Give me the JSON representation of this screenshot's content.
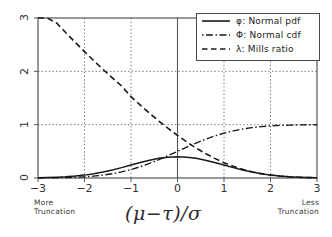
{
  "chart_data": {
    "type": "line",
    "title": "",
    "xlabel": "(μ−τ)/σ",
    "ylabel": "",
    "xlim": [
      -3,
      3
    ],
    "ylim": [
      0,
      3
    ],
    "grid": true,
    "grid_style": "dotted",
    "legend_position": "top-right",
    "xticks": [
      -3,
      -2,
      -1,
      0,
      1,
      2,
      3
    ],
    "xtick_labels": [
      "−3",
      "−2",
      "−1",
      "0",
      "1",
      "2",
      "3"
    ],
    "yticks": [
      0,
      1,
      2,
      3
    ],
    "ytick_labels": [
      "0",
      "1",
      "2",
      "3"
    ],
    "annotations": [
      {
        "text_line1": "More",
        "text_line2": "Truncation",
        "position": "below-axis-left"
      },
      {
        "text_line1": "Less",
        "text_line2": "Truncation",
        "position": "below-axis-right"
      }
    ],
    "x": [
      -3,
      -2.8,
      -2.6,
      -2.4,
      -2.2,
      -2,
      -1.8,
      -1.6,
      -1.4,
      -1.2,
      -1,
      -0.8,
      -0.6,
      -0.4,
      -0.2,
      0,
      0.2,
      0.4,
      0.6,
      0.8,
      1,
      1.2,
      1.4,
      1.6,
      1.8,
      2,
      2.2,
      2.4,
      2.6,
      2.8,
      3
    ],
    "series": [
      {
        "name": "φ: Normal pdf",
        "symbol": "φ",
        "label": "Normal pdf",
        "style": "solid",
        "color": "#1a1a1a",
        "values": [
          0.0044,
          0.0079,
          0.0136,
          0.0224,
          0.0355,
          0.054,
          0.079,
          0.1109,
          0.1497,
          0.1942,
          0.242,
          0.2897,
          0.3332,
          0.3683,
          0.391,
          0.3989,
          0.391,
          0.3683,
          0.3332,
          0.2897,
          0.242,
          0.1942,
          0.1497,
          0.1109,
          0.079,
          0.054,
          0.0355,
          0.0224,
          0.0136,
          0.0079,
          0.0044
        ]
      },
      {
        "name": "Φ: Normal cdf",
        "symbol": "Φ",
        "label": "Normal cdf",
        "style": "dashdot",
        "color": "#1a1a1a",
        "values": [
          0.0013,
          0.0026,
          0.0047,
          0.0082,
          0.0139,
          0.0228,
          0.0359,
          0.0548,
          0.0808,
          0.1151,
          0.1587,
          0.2119,
          0.2743,
          0.3446,
          0.4207,
          0.5,
          0.5793,
          0.6554,
          0.7257,
          0.7881,
          0.8413,
          0.8849,
          0.9192,
          0.9452,
          0.9641,
          0.9772,
          0.9861,
          0.9918,
          0.9953,
          0.9974,
          0.9987
        ]
      },
      {
        "name": "λ: Mills ratio",
        "symbol": "λ",
        "label": "Mills ratio",
        "style": "dashed",
        "color": "#1a1a1a",
        "values": [
          3.2831,
          3.0933,
          2.9065,
          2.7231,
          2.5437,
          2.3688,
          2.1989,
          2.0346,
          1.8763,
          1.7246,
          1.5251,
          1.3672,
          1.2147,
          1.0686,
          0.9293,
          0.7979,
          0.6749,
          0.5617,
          0.4592,
          0.3675,
          0.2876,
          0.2194,
          0.1628,
          0.1173,
          0.0819,
          0.0552,
          0.036,
          0.0226,
          0.0137,
          0.0079,
          0.0044
        ]
      }
    ]
  },
  "legend": {
    "entries": [
      {
        "sample": "solid-line-sample",
        "text": "φ: Normal pdf"
      },
      {
        "sample": "dashdot-line-sample",
        "text": "Φ: Normal cdf"
      },
      {
        "sample": "dashed-line-sample",
        "text": "λ: Mills ratio"
      }
    ]
  },
  "axis": {
    "x_title": "(μ−τ)/σ",
    "xticks": [
      "−3",
      "−2",
      "−1",
      "0",
      "1",
      "2",
      "3"
    ],
    "yticks": [
      "0",
      "1",
      "2",
      "3"
    ]
  },
  "notes": {
    "left_line1": "More",
    "left_line2": "Truncation",
    "right_line1": "Less",
    "right_line2": "Truncation"
  },
  "colors": {
    "line": "#1a1a1a",
    "frame": "#555555",
    "grid": "#777777",
    "background": "#ffffff"
  }
}
